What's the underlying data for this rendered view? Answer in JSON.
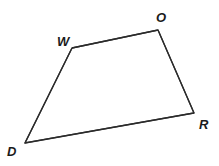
{
  "figure": {
    "name": "quadrilateral-word",
    "type": "polygon",
    "canvas": {
      "width": 219,
      "height": 166,
      "background": "#ffffff"
    },
    "stroke": {
      "color": "#2b2b2b",
      "width": 1.3
    },
    "vertices": [
      {
        "id": "W",
        "label": "W",
        "x": 72,
        "y": 48,
        "label_x": 57,
        "label_y": 35
      },
      {
        "id": "O",
        "label": "O",
        "x": 158,
        "y": 30,
        "label_x": 156,
        "label_y": 11
      },
      {
        "id": "R",
        "label": "R",
        "x": 194,
        "y": 113,
        "label_x": 199,
        "label_y": 118
      },
      {
        "id": "D",
        "label": "D",
        "x": 25,
        "y": 143,
        "label_x": 7,
        "label_y": 145
      }
    ],
    "edges": [
      {
        "id": "WO",
        "from": "W",
        "to": "O"
      },
      {
        "id": "OR",
        "from": "O",
        "to": "R"
      },
      {
        "id": "RD",
        "from": "R",
        "to": "D"
      },
      {
        "id": "DW",
        "from": "D",
        "to": "W"
      }
    ],
    "path": "M 72 48 L 158 30 L 194 113 L 25 143 Z"
  }
}
